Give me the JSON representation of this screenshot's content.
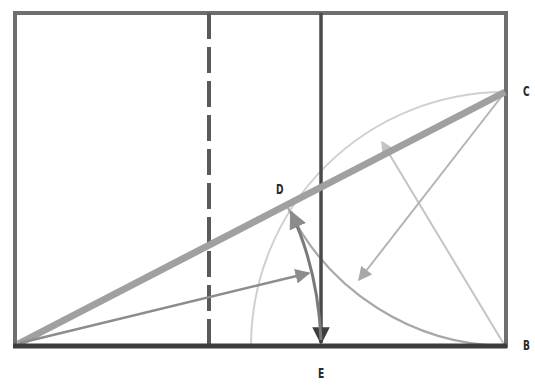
{
  "diagram": {
    "labels": {
      "C": "C",
      "D": "D",
      "B": "B",
      "E": "E"
    },
    "points": {
      "A": [
        18,
        345
      ],
      "B": [
        505,
        346
      ],
      "C": [
        505,
        92
      ],
      "D": [
        288,
        208
      ],
      "E": [
        321,
        346
      ]
    },
    "colors": {
      "frame": "#6e6e6e",
      "frame_bottom": "#3c3c3c",
      "dashed_divider": "#5a5a5a",
      "solid_divider": "#4a4a4a",
      "diagonal": "#a0a0a0",
      "arrow_mid": "#8c8c8c",
      "arrow_light": "#c4c4c4",
      "arc_light": "#d0d0d0",
      "arc_mid": "#a8a8a8",
      "arc_dark": "#7a7a7a",
      "label": "#2a2a2a"
    }
  }
}
